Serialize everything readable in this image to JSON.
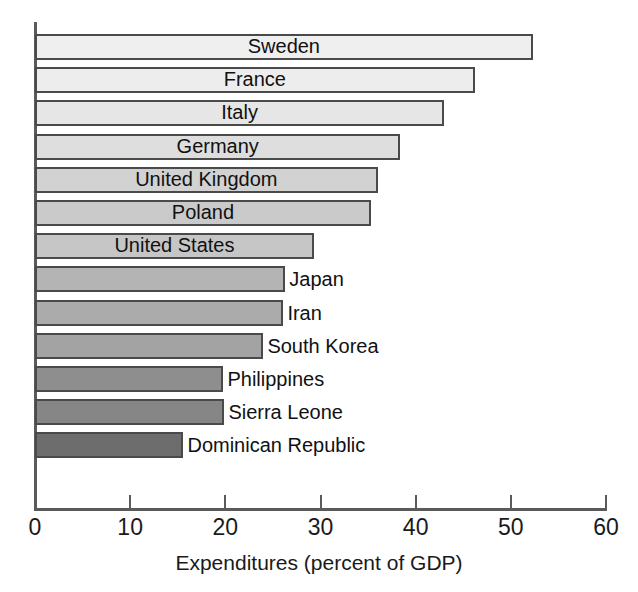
{
  "chart_data": {
    "type": "bar",
    "orientation": "horizontal",
    "title": "",
    "xlabel": "Expenditures (percent of GDP)",
    "ylabel": "",
    "xlim": [
      0,
      60
    ],
    "xticks": [
      0,
      10,
      20,
      30,
      40,
      50,
      60
    ],
    "xtick_labels": [
      "0",
      "10",
      "20",
      "30",
      "40",
      "50",
      "60"
    ],
    "grid": false,
    "legend": "none",
    "categories": [
      "Sweden",
      "France",
      "Italy",
      "Germany",
      "United Kingdom",
      "Poland",
      "United States",
      "Japan",
      "Iran",
      "South Korea",
      "Philippines",
      "Sierra Leone",
      "Dominican Republic"
    ],
    "values": [
      52.3,
      46.2,
      43.0,
      38.4,
      36.0,
      35.3,
      29.3,
      26.3,
      26.1,
      24.0,
      19.8,
      19.9,
      15.6
    ],
    "bars": [
      {
        "label": "Sweden",
        "value": 52.3,
        "fill": "#efefef",
        "label_position": "inside"
      },
      {
        "label": "France",
        "value": 46.2,
        "fill": "#ededed",
        "label_position": "inside"
      },
      {
        "label": "Italy",
        "value": 43.0,
        "fill": "#e6e6e6",
        "label_position": "inside"
      },
      {
        "label": "Germany",
        "value": 38.4,
        "fill": "#dedede",
        "label_position": "inside"
      },
      {
        "label": "United Kingdom",
        "value": 36.0,
        "fill": "#d2d2d2",
        "label_position": "inside"
      },
      {
        "label": "Poland",
        "value": 35.3,
        "fill": "#cacaca",
        "label_position": "inside"
      },
      {
        "label": "United States",
        "value": 29.3,
        "fill": "#c6c6c6",
        "label_position": "inside"
      },
      {
        "label": "Japan",
        "value": 26.3,
        "fill": "#b4b4b4",
        "label_position": "outside"
      },
      {
        "label": "Iran",
        "value": 26.1,
        "fill": "#ababab",
        "label_position": "outside"
      },
      {
        "label": "South Korea",
        "value": 24.0,
        "fill": "#a3a3a3",
        "label_position": "outside"
      },
      {
        "label": "Philippines",
        "value": 19.8,
        "fill": "#8e8e8e",
        "label_position": "outside"
      },
      {
        "label": "Sierra Leone",
        "value": 19.9,
        "fill": "#868686",
        "label_position": "outside"
      },
      {
        "label": "Dominican Republic",
        "value": 15.6,
        "fill": "#6d6d6d",
        "label_position": "outside"
      }
    ],
    "axis_color": "#5a5a5a",
    "bar_border_color": "#4a4a4a",
    "text_color": "#111111"
  }
}
